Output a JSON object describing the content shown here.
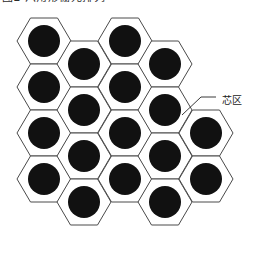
{
  "figure": {
    "title_cropped": "图2 六角形栅元排列",
    "background_color": "#ffffff",
    "hex_stroke_color": "#4a4a4a",
    "circle_fill_color": "#111111",
    "leader_color": "#3a3a3a"
  },
  "annotations": [
    {
      "name": "core-zone",
      "label": "芯区",
      "label_x": 222,
      "label_y": 101,
      "leader_from_x": 216,
      "leader_from_y": 97,
      "leader_mid_x": 201,
      "leader_mid_y": 97,
      "leader_to_x": 182,
      "leader_to_y": 115
    }
  ],
  "lattice": {
    "type": "hexagonal-close-packed",
    "orientation": "flat-top",
    "hex_width": 54,
    "hex_height": 46,
    "column_step": 40.5,
    "row_step": 46,
    "column_offset": 23,
    "circle_radius": 16,
    "total_cells": 18,
    "columns": [
      {
        "index": 1,
        "count": 4,
        "cx": 44,
        "cy_start": 41,
        "offset": false
      },
      {
        "index": 2,
        "count": 4,
        "cx": 84,
        "cy_start": 64,
        "offset": true
      },
      {
        "index": 3,
        "count": 4,
        "cx": 125,
        "cy_start": 41,
        "offset": false
      },
      {
        "index": 4,
        "count": 4,
        "cx": 165,
        "cy_start": 64,
        "offset": true
      },
      {
        "index": 5,
        "count": 2,
        "cx": 206,
        "cy_start": 133,
        "offset": false
      }
    ],
    "cells": [
      {
        "id": 1,
        "col": 1,
        "row": 1,
        "cx": 44,
        "cy": 41
      },
      {
        "id": 2,
        "col": 1,
        "row": 2,
        "cx": 44,
        "cy": 87
      },
      {
        "id": 3,
        "col": 1,
        "row": 3,
        "cx": 44,
        "cy": 133
      },
      {
        "id": 4,
        "col": 1,
        "row": 4,
        "cx": 44,
        "cy": 179
      },
      {
        "id": 5,
        "col": 2,
        "row": 1,
        "cx": 84,
        "cy": 64
      },
      {
        "id": 6,
        "col": 2,
        "row": 2,
        "cx": 84,
        "cy": 110
      },
      {
        "id": 7,
        "col": 2,
        "row": 3,
        "cx": 84,
        "cy": 156
      },
      {
        "id": 8,
        "col": 2,
        "row": 4,
        "cx": 84,
        "cy": 202
      },
      {
        "id": 9,
        "col": 3,
        "row": 1,
        "cx": 125,
        "cy": 41
      },
      {
        "id": 10,
        "col": 3,
        "row": 2,
        "cx": 125,
        "cy": 87
      },
      {
        "id": 11,
        "col": 3,
        "row": 3,
        "cx": 125,
        "cy": 133
      },
      {
        "id": 12,
        "col": 3,
        "row": 4,
        "cx": 125,
        "cy": 179
      },
      {
        "id": 13,
        "col": 4,
        "row": 1,
        "cx": 165,
        "cy": 64
      },
      {
        "id": 14,
        "col": 4,
        "row": 2,
        "cx": 165,
        "cy": 110
      },
      {
        "id": 15,
        "col": 4,
        "row": 3,
        "cx": 165,
        "cy": 156
      },
      {
        "id": 16,
        "col": 4,
        "row": 4,
        "cx": 165,
        "cy": 202
      },
      {
        "id": 17,
        "col": 5,
        "row": 1,
        "cx": 206,
        "cy": 133
      },
      {
        "id": 18,
        "col": 5,
        "row": 2,
        "cx": 206,
        "cy": 179
      }
    ]
  }
}
